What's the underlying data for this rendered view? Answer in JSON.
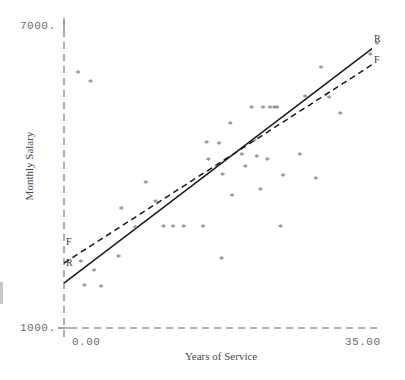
{
  "chart_data": {
    "type": "scatter",
    "title": "",
    "xlabel": "Years of Service",
    "ylabel": "Monthly Salary",
    "xlim": [
      0.0,
      35.0
    ],
    "ylim": [
      1000,
      7000
    ],
    "xticks": [
      "0.00",
      "35.00"
    ],
    "yticks": [
      "7000.",
      "1000."
    ],
    "grid": false,
    "legend_position": "line-ends",
    "marker": "asterisk",
    "marker_color": "#6e6e6e",
    "axis_color": "#9a9a9a",
    "series": [
      {
        "name": "R",
        "label": "R",
        "type": "line",
        "style": "solid",
        "color": "#1a1a1a",
        "endpoints": [
          {
            "x": 0.0,
            "y": 1890
          },
          {
            "x": 35.0,
            "y": 6550
          }
        ]
      },
      {
        "name": "F",
        "label": "F",
        "type": "line",
        "style": "dashed",
        "color": "#1a1a1a",
        "endpoints": [
          {
            "x": 0.0,
            "y": 2290
          },
          {
            "x": 35.0,
            "y": 6230
          }
        ]
      },
      {
        "name": "observations",
        "type": "scatter",
        "points": [
          {
            "x": 1.6,
            "y": 6060
          },
          {
            "x": 3.0,
            "y": 5870
          },
          {
            "x": 1.9,
            "y": 2290
          },
          {
            "x": 2.3,
            "y": 1810
          },
          {
            "x": 3.4,
            "y": 2120
          },
          {
            "x": 4.2,
            "y": 1790
          },
          {
            "x": 6.2,
            "y": 2400
          },
          {
            "x": 6.5,
            "y": 3350
          },
          {
            "x": 8.1,
            "y": 2980
          },
          {
            "x": 9.3,
            "y": 3870
          },
          {
            "x": 10.4,
            "y": 3490
          },
          {
            "x": 11.3,
            "y": 3000
          },
          {
            "x": 12.4,
            "y": 3000
          },
          {
            "x": 13.6,
            "y": 3000
          },
          {
            "x": 15.8,
            "y": 3000
          },
          {
            "x": 16.4,
            "y": 4330
          },
          {
            "x": 16.2,
            "y": 4660
          },
          {
            "x": 17.6,
            "y": 4630
          },
          {
            "x": 17.9,
            "y": 2360
          },
          {
            "x": 18.0,
            "y": 4020
          },
          {
            "x": 18.9,
            "y": 5030
          },
          {
            "x": 19.1,
            "y": 3600
          },
          {
            "x": 20.2,
            "y": 4430
          },
          {
            "x": 20.6,
            "y": 4190
          },
          {
            "x": 21.3,
            "y": 5350
          },
          {
            "x": 21.6,
            "y": 4700
          },
          {
            "x": 21.9,
            "y": 4380
          },
          {
            "x": 22.3,
            "y": 3720
          },
          {
            "x": 22.6,
            "y": 5350
          },
          {
            "x": 23.1,
            "y": 4320
          },
          {
            "x": 23.4,
            "y": 5350
          },
          {
            "x": 23.9,
            "y": 5350
          },
          {
            "x": 24.2,
            "y": 5350
          },
          {
            "x": 24.6,
            "y": 3000
          },
          {
            "x": 24.9,
            "y": 4000
          },
          {
            "x": 26.8,
            "y": 4430
          },
          {
            "x": 27.4,
            "y": 5580
          },
          {
            "x": 28.6,
            "y": 3950
          },
          {
            "x": 29.2,
            "y": 6150
          },
          {
            "x": 30.1,
            "y": 5560
          },
          {
            "x": 31.4,
            "y": 5240
          },
          {
            "x": 34.8,
            "y": 6400
          }
        ]
      }
    ]
  }
}
